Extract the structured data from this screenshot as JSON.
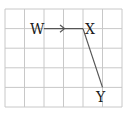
{
  "diagram": {
    "grid": {
      "columns": 6,
      "rows": 5,
      "line_color": "#c8c8c8"
    },
    "points": [
      {
        "id": "W",
        "label": "W",
        "col": 2,
        "row": 1
      },
      {
        "id": "X",
        "label": "X",
        "col": 4,
        "row": 1
      },
      {
        "id": "Y",
        "label": "Y",
        "col": 5,
        "row": 4
      }
    ],
    "segments": [
      {
        "from": "W",
        "to": "X",
        "arrow": true
      },
      {
        "from": "X",
        "to": "Y",
        "arrow": false
      }
    ],
    "line_color": "#555555"
  }
}
